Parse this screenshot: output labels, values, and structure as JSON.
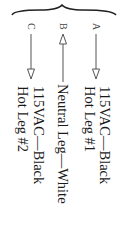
{
  "diagram": {
    "orientation": "rotated-90-clockwise",
    "legs": [
      {
        "letter": "A",
        "arrow": "down",
        "line1": "115VAC—Black",
        "line2": "Hot Leg #1"
      },
      {
        "letter": "B",
        "arrow": "up",
        "line1": "Neutral Leg—White"
      },
      {
        "letter": "C",
        "arrow": "down",
        "line1": "115VAC—Black",
        "line2": "Hot Leg #2"
      }
    ],
    "colors": {
      "ink": "#1a1a1a",
      "arrow": "#555555",
      "background": "#ffffff"
    }
  }
}
